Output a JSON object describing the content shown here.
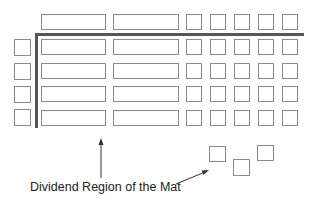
{
  "diagram": {
    "caption": "Dividend Region of the Mat",
    "colors": {
      "box_border": "#8a8a8a",
      "divider": "#555555",
      "arrow": "#333333",
      "text": "#222222"
    },
    "layout": {
      "header_row": {
        "long_tiles": 2,
        "unit_squares": 5
      },
      "body_rows": 4,
      "body_row": {
        "left_unit_squares": 1,
        "long_tiles": 2,
        "unit_squares": 5
      },
      "loose_unit_squares": 3
    },
    "annotations": [
      {
        "text": "Dividend Region of the Mat",
        "points_to": "long tiles region (vertical arrow) and loose unit squares (diagonal arrow)"
      }
    ]
  }
}
